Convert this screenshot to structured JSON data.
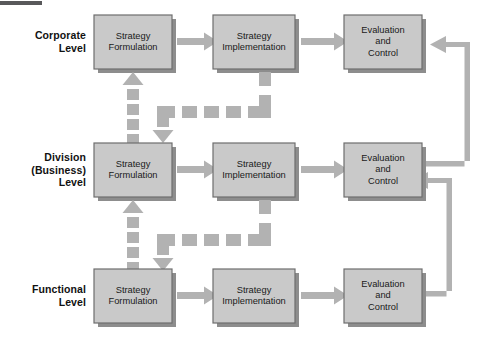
{
  "figure": {
    "type": "hierarchy-strategic-management-flow",
    "rows": [
      {
        "id": "corporate",
        "label_lines": [
          "Corporate",
          "Level"
        ],
        "stages": [
          {
            "id": "strategy-formulation",
            "lines": [
              "Strategy",
              "Formulation"
            ]
          },
          {
            "id": "strategy-implementation",
            "lines": [
              "Strategy",
              "Implementation"
            ]
          },
          {
            "id": "evaluation-and-control",
            "lines": [
              "Evaluation",
              "and",
              "Control"
            ]
          }
        ]
      },
      {
        "id": "division",
        "label_lines": [
          "Division",
          "(Business)",
          "Level"
        ],
        "stages": [
          {
            "id": "strategy-formulation",
            "lines": [
              "Strategy",
              "Formulation"
            ]
          },
          {
            "id": "strategy-implementation",
            "lines": [
              "Strategy",
              "Implementation"
            ]
          },
          {
            "id": "evaluation-and-control",
            "lines": [
              "Evaluation",
              "and",
              "Control"
            ]
          }
        ]
      },
      {
        "id": "functional",
        "label_lines": [
          "Functional",
          "Level"
        ],
        "stages": [
          {
            "id": "strategy-formulation",
            "lines": [
              "Strategy",
              "Formulation"
            ]
          },
          {
            "id": "strategy-implementation",
            "lines": [
              "Strategy",
              "Implementation"
            ]
          },
          {
            "id": "evaluation-and-control",
            "lines": [
              "Evaluation",
              "and",
              "Control"
            ]
          }
        ]
      }
    ],
    "connectors": {
      "solid_flow_arrows": "left-to-right between Strategy Formulation, Strategy Implementation, Evaluation and Control in each row",
      "dashed_arrows": "vertical dashed arrow up into upper Strategy Formulation, dashed horizontal run, dashed arrow down into lower Strategy Formulation",
      "feedback_loops": "right-side solid elbow arrows from lower Evaluation and Control back into the Evaluation and Control box one level above"
    },
    "colors": {
      "box_fill": "#c9c9c9",
      "box_border": "#6e6e6e",
      "box_shadow": "#8d8d8d",
      "connector": "#b2b2b2",
      "connector_dark": "#a0a0a0",
      "text": "#1a1a1a",
      "background": "#ffffff",
      "top_rule": "#58585a"
    }
  },
  "labels": {
    "corporate": {
      "l1": "Corporate",
      "l2": "Level"
    },
    "division": {
      "l1": "Division",
      "l2": "(Business)",
      "l3": "Level"
    },
    "functional": {
      "l1": "Functional",
      "l2": "Level"
    }
  },
  "boxes": {
    "r1c1": {
      "l1": "Strategy",
      "l2": "Formulation"
    },
    "r1c2": {
      "l1": "Strategy",
      "l2": "Implementation"
    },
    "r1c3": {
      "l1": "Evaluation",
      "l2": "and",
      "l3": "Control"
    },
    "r2c1": {
      "l1": "Strategy",
      "l2": "Formulation"
    },
    "r2c2": {
      "l1": "Strategy",
      "l2": "Implementation"
    },
    "r2c3": {
      "l1": "Evaluation",
      "l2": "and",
      "l3": "Control"
    },
    "r3c1": {
      "l1": "Strategy",
      "l2": "Formulation"
    },
    "r3c2": {
      "l1": "Strategy",
      "l2": "Implementation"
    },
    "r3c3": {
      "l1": "Evaluation",
      "l2": "and",
      "l3": "Control"
    }
  }
}
